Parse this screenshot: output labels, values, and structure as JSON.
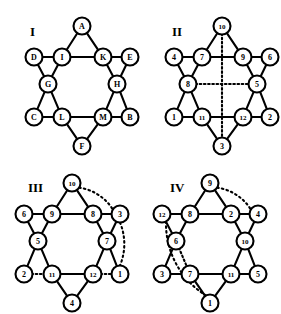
{
  "figure": {
    "background_color": "#ffffff",
    "ink_color": "#000000",
    "panels": [
      {
        "id": "I",
        "label": "I",
        "label_position": {
          "x": 30,
          "y": 36
        },
        "center": {
          "x": 82,
          "y": 86
        },
        "node_radius": 8.5,
        "label_style": "letters",
        "nodes": [
          {
            "id": "A",
            "label": "A",
            "x": 82,
            "y": 26,
            "role": "outer-top"
          },
          {
            "id": "D",
            "label": "D",
            "x": 34,
            "y": 57,
            "role": "outer-upper-left"
          },
          {
            "id": "E",
            "label": "E",
            "x": 130,
            "y": 57,
            "role": "outer-upper-right"
          },
          {
            "id": "I",
            "label": "I",
            "x": 62,
            "y": 57,
            "role": "inner-upper-left"
          },
          {
            "id": "K",
            "label": "K",
            "x": 103,
            "y": 57,
            "role": "inner-upper-right"
          },
          {
            "id": "G",
            "label": "G",
            "x": 48,
            "y": 84,
            "role": "inner-left"
          },
          {
            "id": "H",
            "label": "H",
            "x": 117,
            "y": 84,
            "role": "inner-right"
          },
          {
            "id": "C",
            "label": "C",
            "x": 34,
            "y": 117,
            "role": "outer-lower-left"
          },
          {
            "id": "B",
            "label": "B",
            "x": 130,
            "y": 117,
            "role": "outer-lower-right"
          },
          {
            "id": "L",
            "label": "L",
            "x": 62,
            "y": 117,
            "role": "inner-lower-left"
          },
          {
            "id": "M",
            "label": "M",
            "x": 103,
            "y": 117,
            "role": "inner-lower-right"
          },
          {
            "id": "F",
            "label": "F",
            "x": 82,
            "y": 146,
            "role": "outer-bottom"
          }
        ],
        "edges": [
          {
            "from": "A",
            "to": "I",
            "style": "solid"
          },
          {
            "from": "A",
            "to": "K",
            "style": "solid"
          },
          {
            "from": "I",
            "to": "K",
            "style": "solid"
          },
          {
            "from": "D",
            "to": "I",
            "style": "solid"
          },
          {
            "from": "K",
            "to": "E",
            "style": "solid"
          },
          {
            "from": "D",
            "to": "G",
            "style": "solid"
          },
          {
            "from": "I",
            "to": "G",
            "style": "solid"
          },
          {
            "from": "E",
            "to": "H",
            "style": "solid"
          },
          {
            "from": "K",
            "to": "H",
            "style": "solid"
          },
          {
            "from": "G",
            "to": "C",
            "style": "solid"
          },
          {
            "from": "G",
            "to": "L",
            "style": "solid"
          },
          {
            "from": "H",
            "to": "B",
            "style": "solid"
          },
          {
            "from": "H",
            "to": "M",
            "style": "solid"
          },
          {
            "from": "C",
            "to": "L",
            "style": "solid"
          },
          {
            "from": "L",
            "to": "M",
            "style": "solid"
          },
          {
            "from": "M",
            "to": "B",
            "style": "solid"
          },
          {
            "from": "L",
            "to": "F",
            "style": "solid"
          },
          {
            "from": "M",
            "to": "F",
            "style": "solid"
          }
        ],
        "arcs": []
      },
      {
        "id": "II",
        "label": "II",
        "label_position": {
          "x": 172,
          "y": 36
        },
        "center": {
          "x": 222,
          "y": 86
        },
        "node_radius": 8.5,
        "label_style": "numbers",
        "nodes": [
          {
            "id": "10",
            "label": "10",
            "x": 222,
            "y": 26,
            "role": "outer-top"
          },
          {
            "id": "4",
            "label": "4",
            "x": 174,
            "y": 57,
            "role": "outer-upper-left"
          },
          {
            "id": "6",
            "label": "6",
            "x": 270,
            "y": 57,
            "role": "outer-upper-right"
          },
          {
            "id": "7",
            "label": "7",
            "x": 202,
            "y": 57,
            "role": "inner-upper-left"
          },
          {
            "id": "9",
            "label": "9",
            "x": 243,
            "y": 57,
            "role": "inner-upper-right"
          },
          {
            "id": "8",
            "label": "8",
            "x": 188,
            "y": 84,
            "role": "inner-left"
          },
          {
            "id": "5",
            "label": "5",
            "x": 257,
            "y": 84,
            "role": "inner-right"
          },
          {
            "id": "1",
            "label": "1",
            "x": 174,
            "y": 117,
            "role": "outer-lower-left"
          },
          {
            "id": "2",
            "label": "2",
            "x": 270,
            "y": 117,
            "role": "outer-lower-right"
          },
          {
            "id": "11",
            "label": "11",
            "x": 202,
            "y": 117,
            "role": "inner-lower-left"
          },
          {
            "id": "12",
            "label": "12",
            "x": 243,
            "y": 117,
            "role": "inner-lower-right"
          },
          {
            "id": "3",
            "label": "3",
            "x": 222,
            "y": 146,
            "role": "outer-bottom"
          }
        ],
        "edges": [
          {
            "from": "10",
            "to": "7",
            "style": "solid"
          },
          {
            "from": "10",
            "to": "9",
            "style": "solid"
          },
          {
            "from": "7",
            "to": "9",
            "style": "solid"
          },
          {
            "from": "4",
            "to": "7",
            "style": "solid"
          },
          {
            "from": "9",
            "to": "6",
            "style": "solid"
          },
          {
            "from": "4",
            "to": "8",
            "style": "solid"
          },
          {
            "from": "7",
            "to": "8",
            "style": "solid"
          },
          {
            "from": "6",
            "to": "5",
            "style": "solid"
          },
          {
            "from": "9",
            "to": "5",
            "style": "solid"
          },
          {
            "from": "8",
            "to": "1",
            "style": "solid"
          },
          {
            "from": "8",
            "to": "11",
            "style": "solid"
          },
          {
            "from": "5",
            "to": "2",
            "style": "solid"
          },
          {
            "from": "5",
            "to": "12",
            "style": "solid"
          },
          {
            "from": "1",
            "to": "11",
            "style": "solid"
          },
          {
            "from": "11",
            "to": "12",
            "style": "solid"
          },
          {
            "from": "12",
            "to": "2",
            "style": "solid"
          },
          {
            "from": "11",
            "to": "3",
            "style": "solid"
          },
          {
            "from": "12",
            "to": "3",
            "style": "solid"
          },
          {
            "from": "10",
            "to": "3",
            "style": "dotted",
            "note": "vertical symmetry axis"
          },
          {
            "from": "8",
            "to": "5",
            "style": "dotted",
            "note": "horizontal symmetry axis"
          }
        ],
        "arcs": []
      },
      {
        "id": "III",
        "label": "III",
        "label_position": {
          "x": 28,
          "y": 192
        },
        "center": {
          "x": 72,
          "y": 243
        },
        "node_radius": 8.5,
        "label_style": "numbers",
        "nodes": [
          {
            "id": "10",
            "label": "10",
            "x": 72,
            "y": 183,
            "role": "outer-top"
          },
          {
            "id": "6",
            "label": "6",
            "x": 24,
            "y": 214,
            "role": "outer-upper-left"
          },
          {
            "id": "3",
            "label": "3",
            "x": 120,
            "y": 214,
            "role": "outer-upper-right"
          },
          {
            "id": "9",
            "label": "9",
            "x": 52,
            "y": 214,
            "role": "inner-upper-left"
          },
          {
            "id": "8",
            "label": "8",
            "x": 93,
            "y": 214,
            "role": "inner-upper-right"
          },
          {
            "id": "5",
            "label": "5",
            "x": 38,
            "y": 241,
            "role": "inner-left"
          },
          {
            "id": "7",
            "label": "7",
            "x": 107,
            "y": 241,
            "role": "inner-right"
          },
          {
            "id": "2",
            "label": "2",
            "x": 24,
            "y": 274,
            "role": "outer-lower-left"
          },
          {
            "id": "1",
            "label": "1",
            "x": 120,
            "y": 274,
            "role": "outer-lower-right"
          },
          {
            "id": "11",
            "label": "11",
            "x": 52,
            "y": 274,
            "role": "inner-lower-left"
          },
          {
            "id": "12",
            "label": "12",
            "x": 93,
            "y": 274,
            "role": "inner-lower-right"
          },
          {
            "id": "4",
            "label": "4",
            "x": 72,
            "y": 303,
            "role": "outer-bottom"
          }
        ],
        "edges": [
          {
            "from": "10",
            "to": "9",
            "style": "solid"
          },
          {
            "from": "10",
            "to": "8",
            "style": "solid"
          },
          {
            "from": "9",
            "to": "8",
            "style": "solid"
          },
          {
            "from": "6",
            "to": "9",
            "style": "solid"
          },
          {
            "from": "8",
            "to": "3",
            "style": "solid"
          },
          {
            "from": "6",
            "to": "5",
            "style": "solid"
          },
          {
            "from": "9",
            "to": "5",
            "style": "solid"
          },
          {
            "from": "3",
            "to": "7",
            "style": "solid"
          },
          {
            "from": "8",
            "to": "7",
            "style": "solid"
          },
          {
            "from": "5",
            "to": "2",
            "style": "solid"
          },
          {
            "from": "5",
            "to": "11",
            "style": "solid"
          },
          {
            "from": "7",
            "to": "1",
            "style": "solid"
          },
          {
            "from": "7",
            "to": "12",
            "style": "solid"
          },
          {
            "from": "11",
            "to": "12",
            "style": "solid"
          },
          {
            "from": "11",
            "to": "4",
            "style": "solid"
          },
          {
            "from": "12",
            "to": "4",
            "style": "solid"
          },
          {
            "from": "2",
            "to": "11",
            "style": "dotted"
          },
          {
            "from": "12",
            "to": "1",
            "style": "dotted"
          }
        ],
        "arcs": [
          {
            "from": "10",
            "to": "3",
            "style": "dotted",
            "sweep": "right",
            "bulge": 20
          },
          {
            "from": "3",
            "to": "1",
            "style": "dotted",
            "sweep": "right",
            "bulge": 26
          }
        ]
      },
      {
        "id": "IV",
        "label": "IV",
        "label_position": {
          "x": 170,
          "y": 192
        },
        "center": {
          "x": 210,
          "y": 243
        },
        "node_radius": 8.5,
        "label_style": "numbers",
        "nodes": [
          {
            "id": "9",
            "label": "9",
            "x": 210,
            "y": 183,
            "role": "outer-top"
          },
          {
            "id": "12",
            "label": "12",
            "x": 162,
            "y": 214,
            "role": "outer-upper-left"
          },
          {
            "id": "4",
            "label": "4",
            "x": 258,
            "y": 214,
            "role": "outer-upper-right"
          },
          {
            "id": "8",
            "label": "8",
            "x": 190,
            "y": 214,
            "role": "inner-upper-left"
          },
          {
            "id": "2",
            "label": "2",
            "x": 231,
            "y": 214,
            "role": "inner-upper-right"
          },
          {
            "id": "6",
            "label": "6",
            "x": 176,
            "y": 241,
            "role": "inner-left"
          },
          {
            "id": "10",
            "label": "10",
            "x": 245,
            "y": 241,
            "role": "inner-right"
          },
          {
            "id": "3",
            "label": "3",
            "x": 162,
            "y": 274,
            "role": "outer-lower-left"
          },
          {
            "id": "5",
            "label": "5",
            "x": 258,
            "y": 274,
            "role": "outer-lower-right"
          },
          {
            "id": "7",
            "label": "7",
            "x": 190,
            "y": 274,
            "role": "inner-lower-left"
          },
          {
            "id": "11",
            "label": "11",
            "x": 231,
            "y": 274,
            "role": "inner-lower-right"
          },
          {
            "id": "1",
            "label": "1",
            "x": 210,
            "y": 303,
            "role": "outer-bottom"
          }
        ],
        "edges": [
          {
            "from": "9",
            "to": "8",
            "style": "solid"
          },
          {
            "from": "9",
            "to": "2",
            "style": "solid"
          },
          {
            "from": "8",
            "to": "2",
            "style": "solid"
          },
          {
            "from": "12",
            "to": "8",
            "style": "solid"
          },
          {
            "from": "2",
            "to": "4",
            "style": "solid"
          },
          {
            "from": "12",
            "to": "6",
            "style": "solid"
          },
          {
            "from": "8",
            "to": "6",
            "style": "solid"
          },
          {
            "from": "4",
            "to": "10",
            "style": "solid"
          },
          {
            "from": "2",
            "to": "10",
            "style": "solid"
          },
          {
            "from": "6",
            "to": "3",
            "style": "solid"
          },
          {
            "from": "10",
            "to": "5",
            "style": "solid"
          },
          {
            "from": "10",
            "to": "11",
            "style": "solid"
          },
          {
            "from": "3",
            "to": "7",
            "style": "solid"
          },
          {
            "from": "7",
            "to": "11",
            "style": "solid"
          },
          {
            "from": "11",
            "to": "5",
            "style": "solid"
          },
          {
            "from": "7",
            "to": "1",
            "style": "solid"
          },
          {
            "from": "11",
            "to": "1",
            "style": "solid"
          },
          {
            "from": "6",
            "to": "7",
            "style": "dotted"
          }
        ],
        "arcs": [
          {
            "from": "9",
            "to": "4",
            "style": "dotted",
            "sweep": "right",
            "bulge": 20
          },
          {
            "from": "12",
            "to": "1",
            "style": "dotted",
            "sweep": "left",
            "bulge": 34
          }
        ]
      }
    ]
  }
}
